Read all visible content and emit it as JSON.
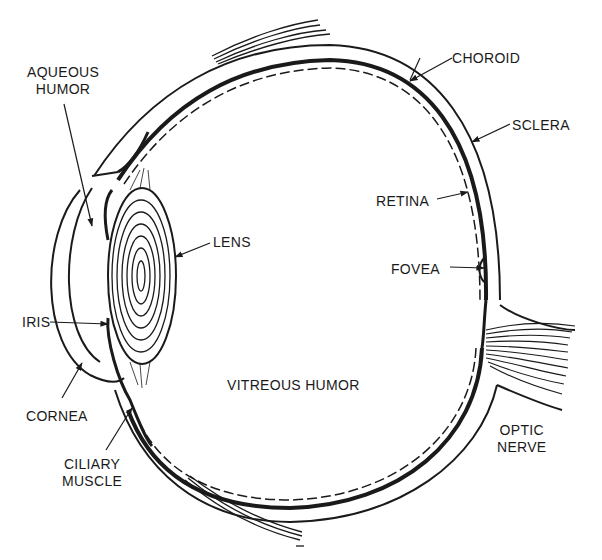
{
  "diagram": {
    "title": "",
    "colors": {
      "ink": "#1a1a1a",
      "background": "#ffffff"
    },
    "labels": {
      "aqueous_humor": {
        "line1": "AQUEOUS",
        "line2": "HUMOR"
      },
      "lens": "LENS",
      "iris": "IRIS",
      "cornea": "CORNEA",
      "ciliary_muscle": {
        "line1": "CILIARY",
        "line2": "MUSCLE"
      },
      "vitreous_humor": "VITREOUS HUMOR",
      "choroid": "CHOROID",
      "sclera": "SCLERA",
      "retina": "RETINA",
      "fovea": "FOVEA",
      "optic_nerve": {
        "line1": "OPTIC",
        "line2": "NERVE"
      }
    }
  }
}
